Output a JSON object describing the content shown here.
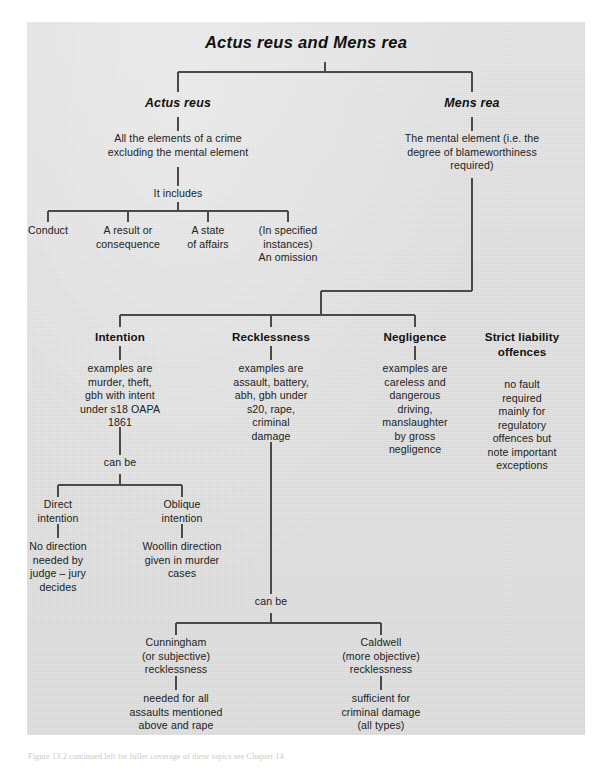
{
  "figure": {
    "title": "Actus reus and Mens rea",
    "caption": "Figure 13.2 continued left for fuller coverage of these topics see Chapter 14."
  },
  "branches": {
    "actus_reus": {
      "heading": "Actus reus",
      "definition": "All the elements of a crime\nexcluding the mental element",
      "connector_label": "It includes",
      "elements": [
        {
          "label": "Conduct"
        },
        {
          "label": "A result or\nconsequence"
        },
        {
          "label": "A state\nof affairs"
        },
        {
          "label": "(In specified\ninstances)\nAn omission"
        }
      ]
    },
    "mens_rea": {
      "heading": "Mens rea",
      "definition": "The mental element (i.e. the\ndegree of blameworthiness\nrequired)",
      "fault_types": [
        {
          "name": "Intention",
          "examples": "examples are\nmurder, theft,\ngbh with intent\nunder s18 OAPA\n1861"
        },
        {
          "name": "Recklessness",
          "examples": "examples are\nassault, battery,\nabh, gbh under\ns20, rape,\ncriminal\ndamage"
        },
        {
          "name": "Negligence",
          "examples": "examples are\ncareless and\ndangerous\ndriving,\nmanslaughter\nby gross\nnegligence"
        },
        {
          "name": "Strict liability\noffences",
          "examples": "no fault\nrequired\nmainly for\nregulatory\noffences but\nnote important\nexceptions"
        }
      ]
    }
  },
  "intention_subtree": {
    "connector_label": "can be",
    "items": [
      {
        "name": "Direct\nintention",
        "detail": "No direction\nneeded by\njudge – jury\ndecides"
      },
      {
        "name": "Oblique\nintention",
        "detail": "Woollin direction\ngiven in murder\ncases"
      }
    ]
  },
  "recklessness_subtree": {
    "connector_label": "can be",
    "items": [
      {
        "name": "Cunningham\n(or subjective)\nrecklessness",
        "detail": "needed for all\nassaults mentioned\nabove and rape"
      },
      {
        "name": "Caldwell\n(more objective)\nrecklessness",
        "detail": "sufficient for\ncriminal damage\n(all types)"
      }
    ]
  },
  "style": {
    "panel_bg": "#dcdcdc",
    "line_color": "#4a4a4a",
    "text_color": "#1b1b1b"
  }
}
